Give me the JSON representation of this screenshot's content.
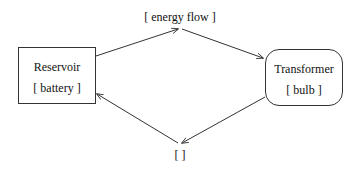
{
  "diagram": {
    "type": "flow-cycle",
    "nodes": {
      "reservoir": {
        "title": "Reservoir",
        "sub": "[ battery ]",
        "shape": "rectangle"
      },
      "transformer": {
        "title": "Transformer",
        "sub": "[ bulb ]",
        "shape": "rounded-rectangle"
      }
    },
    "edges": {
      "top": {
        "label": "[ energy flow ]",
        "from": "reservoir",
        "to": "transformer"
      },
      "bottom": {
        "label": "[ ]",
        "from": "transformer",
        "to": "reservoir"
      }
    },
    "colors": {
      "stroke": "#333333",
      "background": "#ffffff",
      "text": "#111111"
    }
  }
}
